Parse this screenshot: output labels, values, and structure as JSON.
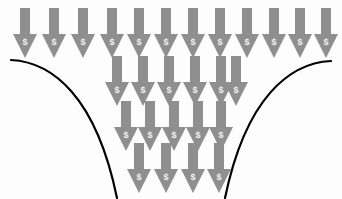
{
  "illustration": {
    "title": "Money Funnel",
    "description": "Rows of downward money arrows converging into a funnel formed by two curved lines",
    "background_color": "#fdfdfd",
    "arrow_color": "#8f8f8f",
    "arrow_symbol_color": "#f2f2f2",
    "curve_color": "#000000",
    "curve_width": 2.2
  },
  "arrow_style": {
    "shaft_width": 10,
    "shaft_height": 26,
    "head_width": 24,
    "head_height": 24,
    "symbol": "$",
    "symbol_font_size": 9
  },
  "curves": {
    "left": {
      "name": "left-funnel-wall",
      "path": "M 11 60 C 52 62, 96 96, 117 198"
    },
    "right": {
      "name": "right-funnel-wall",
      "path": "M 331 61 C 290 63, 246 97, 225 198"
    }
  },
  "rows": [
    {
      "name": "row-1",
      "label": "Top inflow row",
      "count": 12,
      "top": 8,
      "arrows": [
        {
          "cx": 25,
          "symbol": "$"
        },
        {
          "cx": 54,
          "symbol": "$"
        },
        {
          "cx": 83,
          "symbol": "$"
        },
        {
          "cx": 112,
          "symbol": "$"
        },
        {
          "cx": 139,
          "symbol": "$"
        },
        {
          "cx": 166,
          "symbol": "$"
        },
        {
          "cx": 193,
          "symbol": "$"
        },
        {
          "cx": 220,
          "symbol": "$"
        },
        {
          "cx": 247,
          "symbol": "$"
        },
        {
          "cx": 274,
          "symbol": "$"
        },
        {
          "cx": 300,
          "symbol": "$"
        },
        {
          "cx": 326,
          "symbol": "$"
        }
      ]
    },
    {
      "name": "row-2",
      "label": "Second row",
      "count": 6,
      "top": 56,
      "arrows": [
        {
          "cx": 117,
          "symbol": "$"
        },
        {
          "cx": 143,
          "symbol": "$"
        },
        {
          "cx": 169,
          "symbol": "$"
        },
        {
          "cx": 195,
          "symbol": "$"
        },
        {
          "cx": 221,
          "symbol": "$"
        },
        {
          "cx": 236,
          "symbol": "$"
        }
      ]
    },
    {
      "name": "row-3",
      "label": "Third row",
      "count": 5,
      "top": 101,
      "arrows": [
        {
          "cx": 126,
          "symbol": "$"
        },
        {
          "cx": 150,
          "symbol": "$"
        },
        {
          "cx": 174,
          "symbol": "$"
        },
        {
          "cx": 198,
          "symbol": "$"
        },
        {
          "cx": 221,
          "symbol": "$"
        }
      ]
    },
    {
      "name": "row-4",
      "label": "Bottom outflow row",
      "count": 4,
      "top": 143,
      "arrows": [
        {
          "cx": 139,
          "symbol": "$"
        },
        {
          "cx": 166,
          "symbol": "$"
        },
        {
          "cx": 193,
          "symbol": "$"
        },
        {
          "cx": 219,
          "symbol": "$"
        }
      ]
    }
  ]
}
